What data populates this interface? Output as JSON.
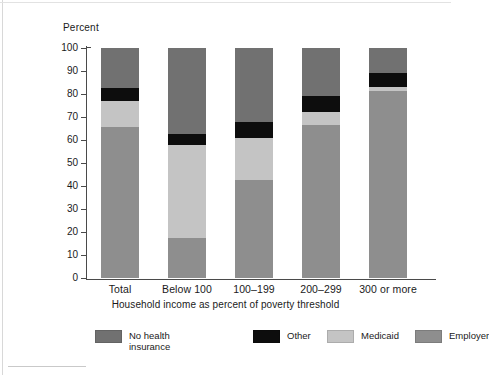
{
  "chart_data": {
    "type": "bar",
    "subtype": "stacked-bar-100",
    "title": "",
    "xlabel": "Household income as percent of poverty threshold",
    "ylabel": "Percent",
    "ylim": [
      0,
      100
    ],
    "yticks": [
      0,
      10,
      20,
      30,
      40,
      50,
      60,
      70,
      80,
      90,
      100
    ],
    "ytick_labels": [
      "0",
      "10",
      "20",
      "30",
      "40",
      "50",
      "60",
      "70",
      "80",
      "90",
      "100"
    ],
    "grid": false,
    "legend_position": "bottom",
    "categories": [
      "Total",
      "Below 100",
      "100–199",
      "200–299",
      "300 or more"
    ],
    "series": [
      {
        "name": "Employer",
        "key": "employer",
        "color": "#8e8e8e",
        "values": [
          65.5,
          17.5,
          42.5,
          66.5,
          81.5
        ]
      },
      {
        "name": "Medicaid",
        "key": "medicaid",
        "color": "#c4c4c4",
        "values": [
          11.5,
          40.5,
          18.5,
          5.5,
          1.5
        ]
      },
      {
        "name": "Other",
        "key": "other",
        "color": "#0d0d0d",
        "values": [
          5.5,
          4.5,
          7.0,
          7.0,
          6.0
        ]
      },
      {
        "name": "No health insurance",
        "key": "noins",
        "color": "#717171",
        "values": [
          17.5,
          37.5,
          32.0,
          21.0,
          11.0
        ]
      }
    ]
  },
  "axis": {
    "y_title": "Percent",
    "x_title": "Household income as percent of poverty threshold"
  },
  "legend": {
    "items": [
      {
        "label": "No health\ninsurance",
        "swatch": "#717171"
      },
      {
        "label": "Other",
        "swatch": "#0d0d0d"
      },
      {
        "label": "Medicaid",
        "swatch": "#c4c4c4"
      },
      {
        "label": "Employer",
        "swatch": "#8e8e8e"
      }
    ]
  }
}
